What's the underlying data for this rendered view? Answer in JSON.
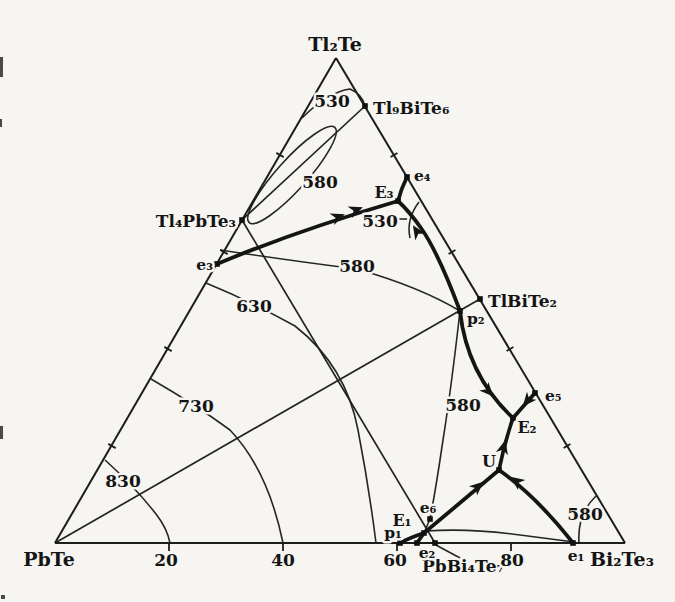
{
  "diagram": {
    "vertices": {
      "top": "Tl₂Te",
      "bottom_left": "PbTe",
      "bottom_right": "Bi₂Te₃"
    },
    "compounds": {
      "tl9bite6": "Tl₉BiTe₆",
      "tl4pbte3": "Tl₄PbTe₃",
      "tlbite2": "TlBiTe₂",
      "pbbi4te7": "PbBi₄Te₇"
    },
    "invariant_points": {
      "e1": "e₁",
      "e2": "e₂",
      "e3": "e₃",
      "e4": "e₄",
      "e5": "e₅",
      "e6": "e₆",
      "E1": "E₁",
      "E2": "E₂",
      "E3": "E₃",
      "p1": "p₁",
      "p2": "p₂",
      "U": "U"
    },
    "isotherm_labels": {
      "top_530": "530",
      "right_530": "530",
      "loop_580": "580",
      "mid_580": "580",
      "lower_580": "580",
      "corner_580": "580",
      "c630": "630",
      "c730": "730",
      "c830": "830"
    },
    "bottom_axis_ticks": [
      "20",
      "40",
      "60",
      "80"
    ]
  }
}
